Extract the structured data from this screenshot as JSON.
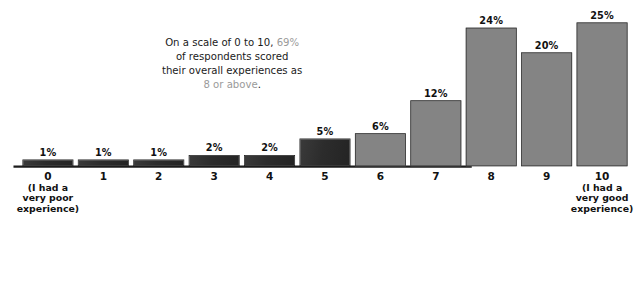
{
  "chart_data": {
    "type": "bar",
    "title": "",
    "subtitle": "",
    "xlabel": "",
    "ylabel": "",
    "categories": [
      "0",
      "1",
      "2",
      "3",
      "4",
      "5",
      "6",
      "7",
      "8",
      "9",
      "10"
    ],
    "values": [
      1,
      1,
      1,
      2,
      2,
      5,
      6,
      12,
      24,
      20,
      25
    ],
    "value_labels": [
      "1%",
      "1%",
      "1%",
      "2%",
      "2%",
      "5%",
      "6%",
      "12%",
      "24%",
      "20%",
      "25%"
    ],
    "value_unit": "%",
    "ylim": [
      0,
      27
    ],
    "grid": false,
    "legend": null,
    "series": [
      {
        "name": "Share of respondents",
        "values": [
          1,
          1,
          1,
          2,
          2,
          5,
          6,
          12,
          24,
          20,
          25
        ]
      }
    ],
    "bar_colors": [
      "#2c2c2c",
      "#2c2c2c",
      "#2c2c2c",
      "#2c2c2c",
      "#2c2c2c",
      "#2c2c2c",
      "#848484",
      "#848484",
      "#848484",
      "#848484",
      "#848484"
    ],
    "axis_caption_left": [
      "(I had a",
      "very poor",
      "experience)"
    ],
    "axis_caption_right": [
      "(I had a",
      "very good",
      "experience)"
    ],
    "annotation": {
      "line1_a": "On a scale of 0 to 10, ",
      "line1_highlight": "69%",
      "line2": "of respondents scored",
      "line3": "their overall experiences as",
      "line4_highlight": "8 or above",
      "line4_b": "."
    }
  },
  "colors": {
    "bar_dark": "#2c2c2c",
    "bar_gray": "#848484",
    "axis": "#1c1c1c",
    "text": "#111111",
    "highlight": "#9a9a9a",
    "background": "#ffffff"
  }
}
